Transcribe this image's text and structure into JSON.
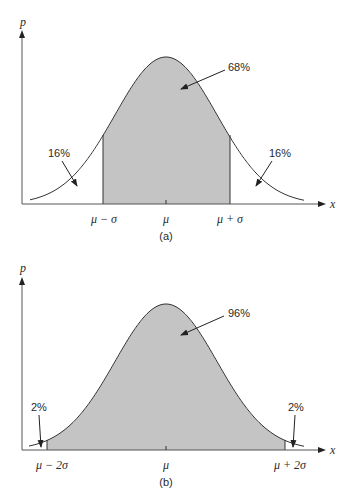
{
  "colors": {
    "fill": "#c4c4c4",
    "line": "#333333",
    "background": "#ffffff"
  },
  "chart_data": [
    {
      "type": "area",
      "title": "(a)",
      "xlabel": "x",
      "ylabel": "p",
      "distribution": "normal",
      "tick_labels": [
        "μ − σ",
        "μ",
        "μ + σ"
      ],
      "shaded_region": [
        "μ − σ",
        "μ + σ"
      ],
      "annotations": [
        {
          "text": "68%",
          "target": "center shaded area"
        },
        {
          "text": "16%",
          "target": "left tail"
        },
        {
          "text": "16%",
          "target": "right tail"
        }
      ],
      "grid": false
    },
    {
      "type": "area",
      "title": "(b)",
      "xlabel": "x",
      "ylabel": "p",
      "distribution": "normal",
      "tick_labels": [
        "μ − 2σ",
        "μ",
        "μ + 2σ"
      ],
      "shaded_region": [
        "μ − 2σ",
        "μ + 2σ"
      ],
      "annotations": [
        {
          "text": "96%",
          "target": "center shaded area"
        },
        {
          "text": "2%",
          "target": "left tail"
        },
        {
          "text": "2%",
          "target": "right tail"
        }
      ],
      "grid": false
    }
  ],
  "panels": {
    "a": {
      "caption": "(a)",
      "y_axis_label": "p",
      "x_axis_label": "x",
      "ticks": {
        "left": "μ − σ",
        "mid": "μ",
        "right": "μ + σ"
      },
      "center_pct": "68%",
      "left_pct": "16%",
      "right_pct": "16%"
    },
    "b": {
      "caption": "(b)",
      "y_axis_label": "p",
      "x_axis_label": "x",
      "ticks": {
        "left": "μ − 2σ",
        "mid": "μ",
        "right": "μ + 2σ"
      },
      "center_pct": "96%",
      "left_pct": "2%",
      "right_pct": "2%"
    }
  }
}
